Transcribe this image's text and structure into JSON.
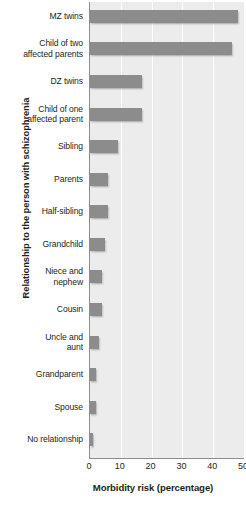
{
  "chart_data": {
    "type": "bar",
    "orientation": "horizontal",
    "title": "",
    "xlabel": "Morbidity risk (percentage)",
    "ylabel": "Relationship to the person with schizophrenia",
    "xlim": [
      0,
      50
    ],
    "xticks": [
      0,
      10,
      20,
      30,
      40,
      50
    ],
    "grid": true,
    "legend": null,
    "bar_color": "#8c8c8c",
    "plot_background": "#ececec",
    "gridline_color": "#ffffff",
    "axis_color": "#8d8d8d",
    "categories": [
      "MZ twins",
      "Child of two affected parents",
      "DZ twins",
      "Child of one affected parent",
      "Sibling",
      "Parents",
      "Half-sibling",
      "Grandchild",
      "Niece and nephew",
      "Cousin",
      "Uncle and aunt",
      "Grandparent",
      "Spouse",
      "No relationship"
    ],
    "category_labels": [
      [
        "MZ twins"
      ],
      [
        "Child of two",
        "affected parents"
      ],
      [
        "DZ twins"
      ],
      [
        "Child of one",
        "affected parent"
      ],
      [
        "Sibling"
      ],
      [
        "Parents"
      ],
      [
        "Half-sibling"
      ],
      [
        "Grandchild"
      ],
      [
        "Niece and",
        "nephew"
      ],
      [
        "Cousin"
      ],
      [
        "Uncle and",
        "aunt"
      ],
      [
        "Grandparent"
      ],
      [
        "Spouse"
      ],
      [
        "No relationship"
      ]
    ],
    "values": [
      48,
      46,
      17,
      17,
      9,
      6,
      6,
      5,
      4,
      4,
      3,
      2,
      2,
      1
    ]
  }
}
